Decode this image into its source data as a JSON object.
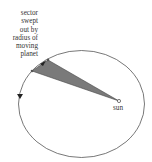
{
  "diagram": {
    "sector_label_lines": [
      "sector",
      "swept",
      "out by",
      "radius of",
      "moving",
      "planet"
    ],
    "sun_label": "sun",
    "colors": {
      "orbit": "#555555",
      "sector_fill": "#7a7a7a",
      "sector_stroke": "#444444",
      "text": "#333333",
      "arrow": "#222222"
    }
  }
}
